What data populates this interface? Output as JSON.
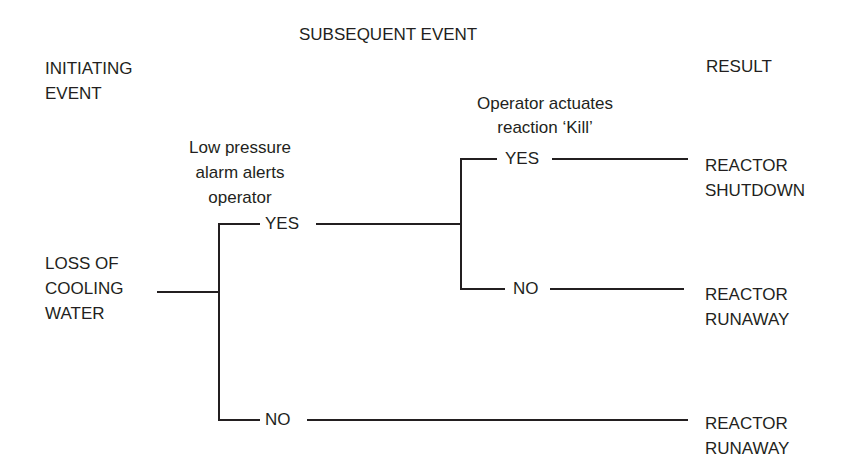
{
  "headers": {
    "subsequent_event": "SUBSEQUENT EVENT",
    "initiating_event": [
      "INITIATING",
      "EVENT"
    ],
    "result": "RESULT"
  },
  "initiating_event": [
    "LOSS OF",
    "COOLING",
    "WATER"
  ],
  "events": [
    {
      "label": [
        "Low pressure",
        "alarm alerts",
        "operator"
      ],
      "yes": "YES",
      "no": "NO"
    },
    {
      "label": [
        "Operator actuates",
        "reaction ‘Kill’"
      ],
      "yes": "YES",
      "no": "NO"
    }
  ],
  "outcomes": [
    {
      "path": "YES-YES",
      "label": [
        "REACTOR",
        "SHUTDOWN"
      ]
    },
    {
      "path": "YES-NO",
      "label": [
        "REACTOR",
        "RUNAWAY"
      ]
    },
    {
      "path": "NO",
      "label": [
        "REACTOR",
        "RUNAWAY"
      ]
    }
  ],
  "colors": {
    "line": "#231f20",
    "text": "#231f20",
    "background": "#ffffff"
  }
}
